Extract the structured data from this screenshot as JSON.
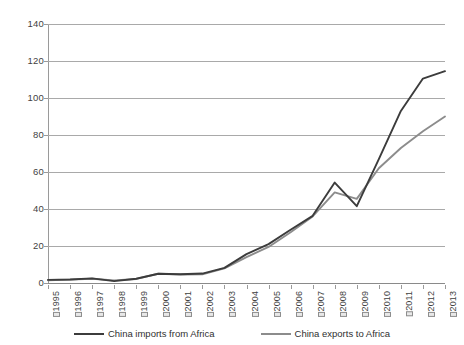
{
  "chart_data": {
    "type": "line",
    "title": "",
    "subtitle": "",
    "xlabel": "",
    "ylabel": "",
    "categories": [
      "1995",
      "1996",
      "1997",
      "1998",
      "1999",
      "2000",
      "2001",
      "2002",
      "2003",
      "2004",
      "2005",
      "2006",
      "2007",
      "2008",
      "2009",
      "2010",
      "2011",
      "2012",
      "2013"
    ],
    "x_tick_prefix": "□",
    "ylim": [
      0,
      140
    ],
    "y_ticks": [
      0,
      20,
      40,
      60,
      80,
      100,
      120,
      140
    ],
    "grid": "horizontal",
    "legend_position": "bottom",
    "series": [
      {
        "name": "China imports from Africa",
        "color": "#3c3c3c",
        "values": [
          1.7,
          1.9,
          2.5,
          1.0,
          2.3,
          5.0,
          4.7,
          5.1,
          8.2,
          15.6,
          21.0,
          28.8,
          36.3,
          54.3,
          41.5,
          67.0,
          93.0,
          110.5,
          114.5
        ]
      },
      {
        "name": "China exports to Africa",
        "color": "#8c8c8c",
        "values": [
          1.5,
          1.8,
          2.3,
          1.4,
          2.2,
          5.0,
          4.6,
          4.7,
          7.9,
          14.0,
          19.5,
          27.4,
          36.0,
          49.0,
          45.5,
          62.0,
          73.0,
          82.0,
          90.0
        ]
      }
    ]
  },
  "legend": {
    "items": [
      {
        "label": "China imports from Africa"
      },
      {
        "label": "China exports to Africa"
      }
    ]
  }
}
